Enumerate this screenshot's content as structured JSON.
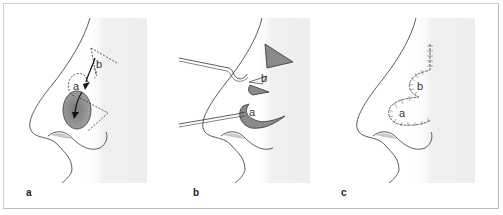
{
  "figure": {
    "panels": [
      {
        "id": "a",
        "label": "a",
        "annotations": [
          "a",
          "b"
        ]
      },
      {
        "id": "b",
        "label": "b",
        "annotations": [
          "a",
          "b"
        ]
      },
      {
        "id": "c",
        "label": "c",
        "annotations": [
          "a",
          "b"
        ]
      }
    ],
    "colors": {
      "line": "#333333",
      "flap_fill": "#8a8a8a",
      "background_shade": "#eeeeee",
      "border": "#cccccc"
    }
  }
}
